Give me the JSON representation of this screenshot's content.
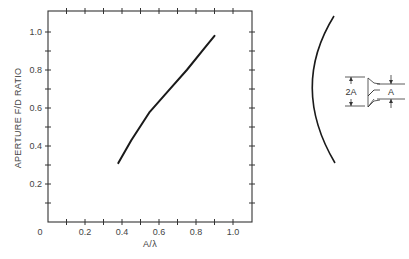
{
  "chart_data": {
    "type": "line",
    "title": "",
    "xlabel": "A/λ",
    "ylabel": "APERTURE F/D RATIO",
    "xlim": [
      0,
      1.1
    ],
    "ylim": [
      0,
      1.1
    ],
    "grid": false,
    "legend": null,
    "x_tick_labels": [
      "0",
      "0.2",
      "0.4",
      "0.6",
      "0.8",
      "1.0"
    ],
    "x_ticks": [
      0,
      0.2,
      0.4,
      0.6,
      0.8,
      1.0
    ],
    "y_tick_labels": [
      "0.2",
      "0.4",
      "0.6",
      "0.8",
      "1.0"
    ],
    "y_ticks": [
      0.2,
      0.4,
      0.6,
      0.8,
      1.0
    ],
    "minor_tick_step": 0.1,
    "series": [
      {
        "name": "F/D ratio",
        "x": [
          0.38,
          0.45,
          0.55,
          0.65,
          0.75,
          0.85,
          0.9
        ],
        "values": [
          0.31,
          0.43,
          0.58,
          0.69,
          0.8,
          0.92,
          0.98
        ]
      }
    ]
  },
  "diagram": {
    "label_2a": "2A",
    "label_a": "A"
  }
}
